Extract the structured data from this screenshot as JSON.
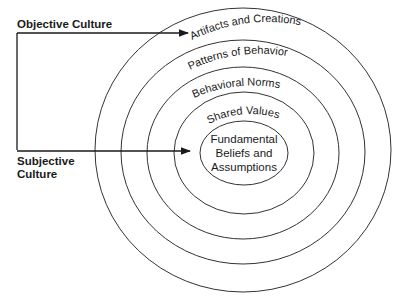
{
  "diagram": {
    "side_labels": {
      "objective": "Objective Culture",
      "subjective_line1": "Subjective",
      "subjective_line2": "Culture"
    },
    "rings": [
      {
        "label": "Artifacts and Creations"
      },
      {
        "label": "Patterns of Behavior"
      },
      {
        "label": "Behavioral Norms"
      },
      {
        "label": "Shared Values"
      }
    ],
    "core": {
      "line1": "Fundamental",
      "line2": "Beliefs and",
      "line3": "Assumptions"
    },
    "colors": {
      "line": "#333333",
      "text": "#1a1a1a",
      "background": "#ffffff"
    }
  }
}
